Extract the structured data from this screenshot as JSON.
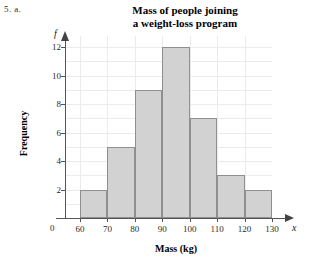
{
  "question_label": "5. a.",
  "chart_data": {
    "type": "bar",
    "title": "Mass of people joining a weight-loss program",
    "title_lines": [
      "Mass of people joining",
      "a weight-loss program"
    ],
    "xlabel": "Mass (kg)",
    "ylabel": "Frequency",
    "x_axis_variable": "x",
    "y_axis_variable": "f",
    "origin_label": "0",
    "categories": [
      "60-70",
      "70-80",
      "80-90",
      "90-100",
      "100-110",
      "110-120",
      "120-130"
    ],
    "bin_edges": [
      60,
      70,
      80,
      90,
      100,
      110,
      120,
      130
    ],
    "values": [
      2,
      5,
      9,
      12,
      7,
      3,
      2
    ],
    "xlim": [
      60,
      130
    ],
    "ylim": [
      0,
      12
    ],
    "x_tick_labels": [
      "60",
      "70",
      "80",
      "90",
      "100",
      "110",
      "120",
      "130"
    ],
    "y_tick_labels": [
      "2",
      "4",
      "6",
      "8",
      "10",
      "12"
    ],
    "y_tick_values": [
      2,
      4,
      6,
      8,
      10,
      12
    ],
    "grid": true,
    "legend": "none",
    "bar_fill_color": "#d2d2d2",
    "bar_border_color": "#8f8f8f",
    "grid_color": "#ebebeb",
    "axis_color": "#555555"
  }
}
